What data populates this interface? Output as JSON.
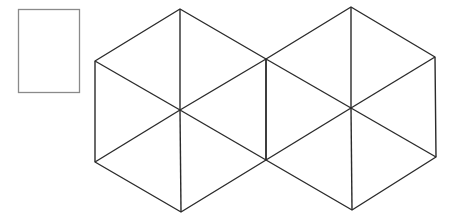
{
  "canvas": {
    "width": 451,
    "height": 217,
    "background": "#ffffff"
  },
  "colors": {
    "rect_stroke": "#8a8a8a",
    "line_stroke": "#2b2b2b"
  },
  "rectangle": {
    "x": 18,
    "y": 9,
    "width": 61,
    "height": 83
  },
  "hexagons": [
    {
      "name": "left-hexagon",
      "center": [
        180,
        110
      ],
      "vertices": [
        [
          180,
          9
        ],
        [
          266,
          59
        ],
        [
          266,
          160
        ],
        [
          181,
          212
        ],
        [
          95,
          162
        ],
        [
          95,
          61
        ]
      ]
    },
    {
      "name": "right-hexagon",
      "center": [
        351,
        108
      ],
      "vertices": [
        [
          351,
          7
        ],
        [
          435,
          57
        ],
        [
          436,
          157
        ],
        [
          352,
          210
        ],
        [
          266,
          160
        ],
        [
          266,
          59
        ]
      ]
    }
  ]
}
